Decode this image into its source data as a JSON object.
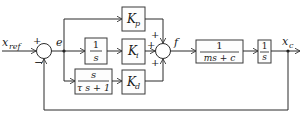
{
  "diagram": {
    "type": "block-diagram",
    "signals": {
      "reference": {
        "base": "x",
        "sub": "ref"
      },
      "error": "e",
      "force": "f",
      "output": {
        "base": "x",
        "sub": "c"
      }
    },
    "sum1_signs": {
      "reference": "+",
      "feedback": "−"
    },
    "sum2_signs": {
      "proportional": "+",
      "integral": "+",
      "derivative": "+"
    },
    "blocks": {
      "integrator": {
        "num": "1",
        "den": "s"
      },
      "derivative_filter": {
        "num": "s",
        "den": "τ s + 1"
      },
      "kp": {
        "base": "K",
        "sub": "p"
      },
      "ki": {
        "base": "K",
        "sub": "i"
      },
      "kd": {
        "base": "K",
        "sub": "d"
      },
      "plant": {
        "num": "1",
        "den": "ms + c"
      },
      "plant_integrator": {
        "num": "1",
        "den": "s"
      }
    }
  }
}
